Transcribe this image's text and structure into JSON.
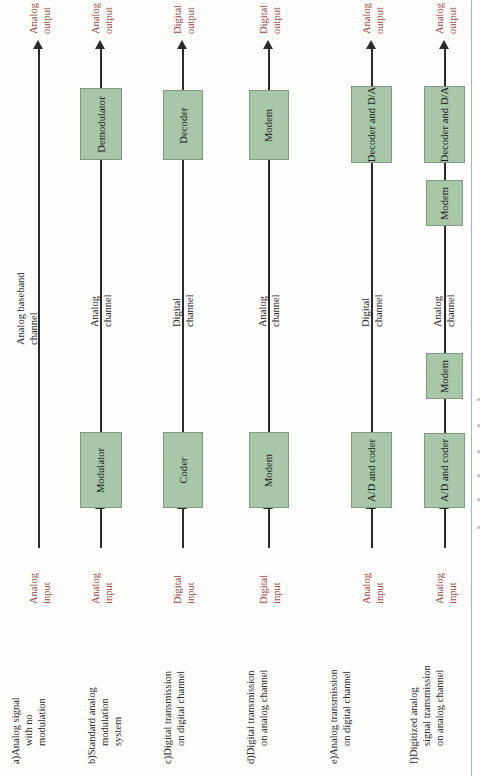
{
  "figure": {
    "type": "block-diagram",
    "orientation": "rotated-90-ccw",
    "box_fill": "#a8c6a8",
    "box_stroke": "#7d9b80",
    "line_color": "#2b2b2b",
    "io_label_color": "#a14a3e",
    "channel_label_color": "#2a2a2a"
  },
  "chains": [
    {
      "id": "a",
      "caption": {
        "tag": "a)",
        "lines": [
          "Analog signal",
          "with no",
          "modulation"
        ]
      },
      "input": {
        "lines": [
          "Analog",
          "input"
        ]
      },
      "output": {
        "lines": [
          "Analog",
          "output"
        ]
      },
      "channel": {
        "lines": [
          "Analog baseband",
          "channel"
        ]
      },
      "boxes": []
    },
    {
      "id": "b",
      "caption": {
        "tag": "b)",
        "lines": [
          "Standard analog",
          "modulation",
          "system"
        ]
      },
      "input": {
        "lines": [
          "Analog",
          "input"
        ]
      },
      "output": {
        "lines": [
          "Analog",
          "output"
        ]
      },
      "channel": {
        "lines": [
          "Analog",
          "channel"
        ]
      },
      "boxes": [
        {
          "label": "Modulator"
        },
        {
          "label": "Demodulator"
        }
      ]
    },
    {
      "id": "c",
      "caption": {
        "tag": "c)",
        "lines": [
          "Digital transmission",
          "on digital channel"
        ]
      },
      "input": {
        "lines": [
          "Digital",
          "input"
        ]
      },
      "output": {
        "lines": [
          "Digital",
          "output"
        ]
      },
      "channel": {
        "lines": [
          "Digital",
          "channel"
        ]
      },
      "boxes": [
        {
          "label": "Coder"
        },
        {
          "label": "Decoder"
        }
      ]
    },
    {
      "id": "d",
      "caption": {
        "tag": "d)",
        "lines": [
          "Digital transmission",
          "on analog channel"
        ]
      },
      "input": {
        "lines": [
          "Digital",
          "input"
        ]
      },
      "output": {
        "lines": [
          "Digital",
          "output"
        ]
      },
      "channel": {
        "lines": [
          "Analog",
          "channel"
        ]
      },
      "boxes": [
        {
          "label": "Modem"
        },
        {
          "label": "Modem"
        }
      ]
    },
    {
      "id": "e",
      "caption": {
        "tag": "e)",
        "lines": [
          "Analog transmission",
          "on digital channel"
        ]
      },
      "input": {
        "lines": [
          "Analog",
          "input"
        ]
      },
      "output": {
        "lines": [
          "Analog",
          "output"
        ]
      },
      "channel": {
        "lines": [
          "Digital",
          "channel"
        ]
      },
      "boxes": [
        {
          "label": "A/D and coder"
        },
        {
          "label": "Decoder and D/A"
        }
      ]
    },
    {
      "id": "f",
      "caption": {
        "tag": "f)",
        "lines": [
          "Digitized analog",
          "signal transmission",
          "on analog channel"
        ]
      },
      "input": {
        "lines": [
          "Analog",
          "input"
        ]
      },
      "output": {
        "lines": [
          "Analog",
          "output"
        ]
      },
      "channel": {
        "lines": [
          "Analog",
          "channel"
        ]
      },
      "boxes": [
        {
          "label": "A/D and coder"
        },
        {
          "label": "Modem"
        },
        {
          "label": "Modem"
        },
        {
          "label": "Decoder and D/A"
        }
      ]
    }
  ]
}
